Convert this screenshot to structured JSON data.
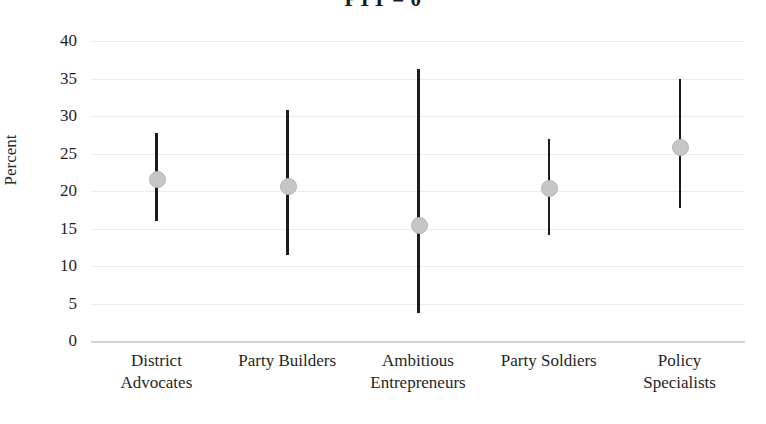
{
  "chart_data": {
    "type": "scatter",
    "title": "PTT = 0",
    "xlabel": "",
    "ylabel": "Percent",
    "ylim": [
      0,
      40
    ],
    "yticks": [
      0,
      5,
      10,
      15,
      20,
      25,
      30,
      35,
      40
    ],
    "grid": true,
    "legend": "none",
    "error_bars": "vertical",
    "categories": [
      "District Advocates",
      "Party Builders",
      "Ambitious Entrepreneurs",
      "Party Soldiers",
      "Policy Specialists"
    ],
    "category_lines": [
      [
        "District",
        "Advocates"
      ],
      [
        "Party Builders",
        ""
      ],
      [
        "Ambitious",
        "Entrepreneurs"
      ],
      [
        "Party Soldiers",
        ""
      ],
      [
        "Policy",
        "Specialists"
      ]
    ],
    "values": [
      21.7,
      20.8,
      15.6,
      20.5,
      26.0
    ],
    "ci_low": [
      16.0,
      11.5,
      3.7,
      14.1,
      17.7
    ],
    "ci_high": [
      27.7,
      30.8,
      36.3,
      27.0,
      35.0
    ],
    "marker_color": "#c6c6c6",
    "line_color": "#1c1c1c",
    "grid_color": "#ececed"
  }
}
